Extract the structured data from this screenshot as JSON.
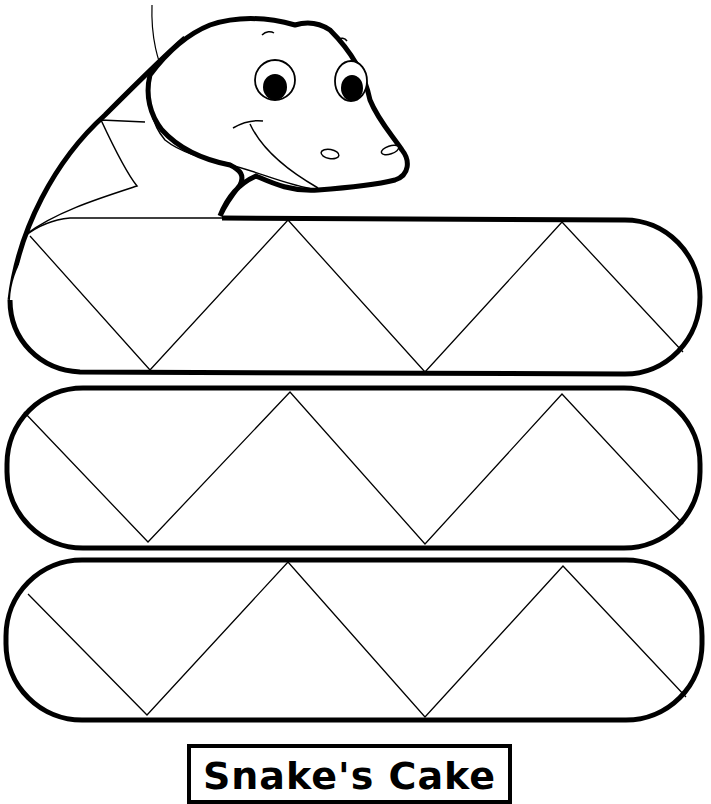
{
  "title_label": "Snake's Cake",
  "colors": {
    "outline": "#000000",
    "background": "#ffffff"
  },
  "figure": {
    "bands": 3,
    "pattern": "zigzag triangles"
  }
}
